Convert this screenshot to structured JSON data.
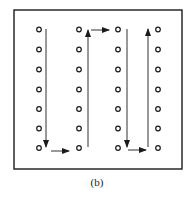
{
  "figure": {
    "caption": "(b)",
    "frame": {
      "x": 14,
      "y": 10,
      "width": 168,
      "height": 159,
      "stroke": "#1a1a1a"
    },
    "grid": {
      "columns_x": [
        39,
        79,
        118,
        158
      ],
      "rows_y": [
        29.5,
        49.5,
        69.5,
        89.5,
        109,
        128.5,
        148
      ],
      "point_radius": 2.3,
      "point_shape": "hollow-circle",
      "color": "#1a1a1a"
    },
    "path": {
      "description": "Serpentine (boustrophedon) scan path",
      "color": "#333333",
      "segments": [
        {
          "id": "col1-down",
          "direction": "down",
          "x1": 46,
          "y1": 29,
          "x2": 46,
          "y2": 147
        },
        {
          "id": "bottom-right-1",
          "direction": "right",
          "x1": 51,
          "y1": 151,
          "x2": 69,
          "y2": 151
        },
        {
          "id": "col2-up",
          "direction": "up",
          "x1": 88,
          "y1": 147,
          "x2": 88,
          "y2": 30
        },
        {
          "id": "top-right",
          "direction": "right",
          "x1": 91,
          "y1": 30,
          "x2": 109,
          "y2": 30
        },
        {
          "id": "col3-down",
          "direction": "down",
          "x1": 127,
          "y1": 29,
          "x2": 127,
          "y2": 147
        },
        {
          "id": "bottom-right-2",
          "direction": "right",
          "x1": 128,
          "y1": 150,
          "x2": 146,
          "y2": 150
        },
        {
          "id": "col4-up",
          "direction": "up",
          "x1": 148,
          "y1": 147,
          "x2": 148,
          "y2": 29
        }
      ]
    }
  }
}
